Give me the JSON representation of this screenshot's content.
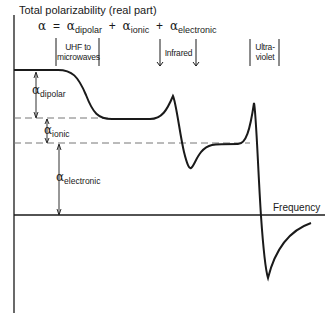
{
  "title": "Total polarizability (real part)",
  "equation": {
    "lhs": "α",
    "equals": "=",
    "terms": [
      {
        "symbol": "α",
        "sub": "dipolar"
      },
      {
        "symbol": "α",
        "sub": "ionic"
      },
      {
        "symbol": "α",
        "sub": "electronic"
      }
    ],
    "plus": "+"
  },
  "regions": [
    {
      "line1": "UHF to",
      "line2": "microwaves"
    },
    {
      "line1": "Infrared",
      "line2": ""
    },
    {
      "line1": "Ultra-",
      "line2": "violet"
    }
  ],
  "annotations": {
    "dipolar": {
      "symbol": "α",
      "sub": "dipolar"
    },
    "ionic": {
      "symbol": "α",
      "sub": "ionic"
    },
    "electronic": {
      "symbol": "α",
      "sub": "electronic"
    }
  },
  "x_axis_label": "Frequency",
  "colors": {
    "line": "#1a1a1a",
    "dashed": "#777777",
    "background": "#ffffff"
  }
}
